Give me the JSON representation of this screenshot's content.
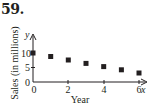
{
  "problem_number": "59.",
  "chart_data": {
    "type": "scatter",
    "title": "",
    "xlabel": "Year",
    "ylabel": "Sales (in millions)",
    "x_axis_var": "x",
    "y_axis_var": "y",
    "x": [
      0,
      1,
      2,
      3,
      4,
      5,
      6
    ],
    "values": [
      10,
      8.8,
      7.6,
      6.4,
      5.3,
      4.2,
      3.1
    ],
    "xticks": [
      "0",
      "2",
      "4",
      "6"
    ],
    "yticks": [
      "0",
      "5",
      "10"
    ],
    "xlim": [
      0,
      6.6
    ],
    "ylim": [
      0,
      13
    ],
    "grid": false,
    "legend": null,
    "marker": "square",
    "marker_color": "#231f20"
  }
}
